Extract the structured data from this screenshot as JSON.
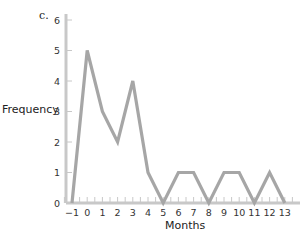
{
  "chart_data": {
    "type": "line",
    "panel_label": "c.",
    "title": "",
    "xlabel": "Months",
    "ylabel": "Frequency",
    "x": [
      -1,
      0,
      1,
      2,
      3,
      4,
      5,
      6,
      7,
      8,
      9,
      10,
      11,
      12,
      13
    ],
    "series": [
      {
        "name": "Frequency",
        "values": [
          0,
          5,
          3,
          2,
          4,
          1,
          0,
          1,
          1,
          0,
          1,
          1,
          0,
          1,
          0
        ],
        "color": "#a6a6a6"
      }
    ],
    "xlim": [
      -1,
      13
    ],
    "ylim": [
      0,
      6
    ],
    "x_ticks": [
      "−1",
      "0",
      "1",
      "2",
      "3",
      "4",
      "5",
      "6",
      "7",
      "8",
      "9",
      "10",
      "11",
      "12",
      "13"
    ],
    "y_ticks": [
      "0",
      "1",
      "2",
      "3",
      "4",
      "5",
      "6"
    ],
    "grid": false,
    "legend": null,
    "axis_color": "#c8c8c8"
  }
}
